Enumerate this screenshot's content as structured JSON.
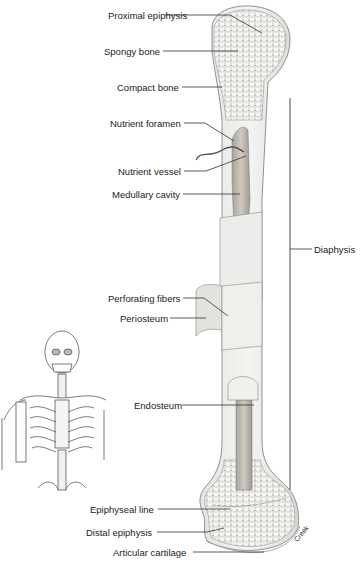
{
  "figure": {
    "labels": {
      "proximal_epiphysis": "Proximal epiphysis",
      "spongy_bone": "Spongy bone",
      "compact_bone": "Compact bone",
      "nutrient_foramen": "Nutrient foramen",
      "nutrient_vessel": "Nutrient vessel",
      "medullary_cavity": "Medullary cavity",
      "diaphysis": "Diaphysis",
      "perforating_fibers": "Perforating fibers",
      "periosteum": "Periosteum",
      "endosteum": "Endosteum",
      "epiphyseal_line": "Epiphyseal line",
      "distal_epiphysis": "Distal epiphysis",
      "articular_cartilage": "Articular cartilage"
    },
    "artist_credit": "Creek",
    "inset": "skeleton-upper-body"
  }
}
